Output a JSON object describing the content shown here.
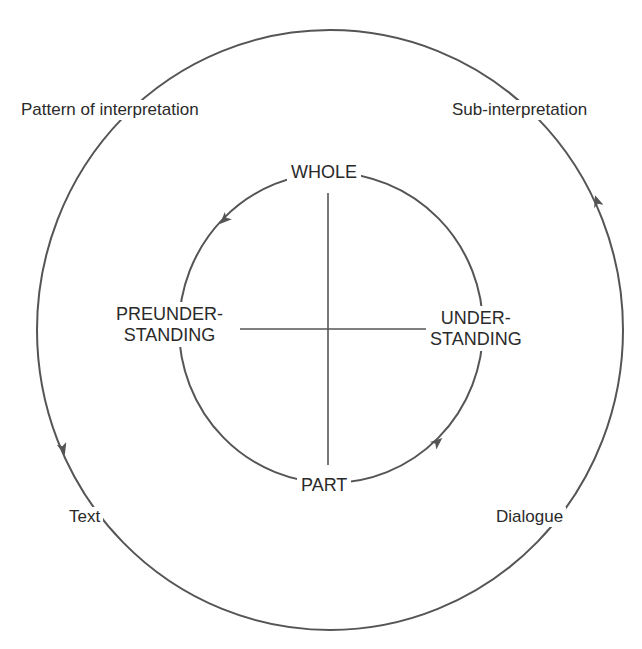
{
  "diagram": {
    "outer_cycle": {
      "labels": {
        "top_left": "Pattern of interpretation",
        "top_right": "Sub-interpretation",
        "bottom_left": "Text",
        "bottom_right": "Dialogue"
      },
      "direction": "counterclockwise"
    },
    "inner_cycle": {
      "labels": {
        "top": "WHOLE",
        "left_line1": "PREUNDER-",
        "left_line2": "STANDING",
        "right_line1": "UNDER-",
        "right_line2": "STANDING",
        "bottom": "PART"
      },
      "direction": "counterclockwise"
    },
    "colors": {
      "line": "#555555",
      "text": "#2a2a2a",
      "background": "#ffffff"
    }
  }
}
